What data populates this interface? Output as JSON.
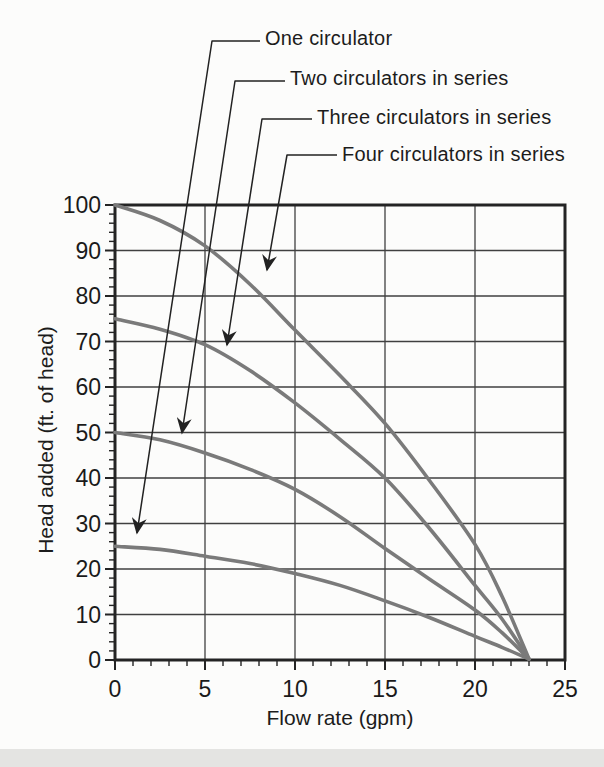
{
  "page": {
    "background_color": "#fcfcfb",
    "footer_band_color": "#e4e4e2"
  },
  "chart_data": {
    "type": "line",
    "title": "",
    "xlabel": "Flow rate (gpm)",
    "ylabel": "Head added (ft. of head)",
    "xlim": [
      0,
      25
    ],
    "ylim": [
      0,
      100
    ],
    "x_ticks": [
      0,
      5,
      10,
      15,
      20,
      25
    ],
    "y_ticks": [
      0,
      10,
      20,
      30,
      40,
      50,
      60,
      70,
      80,
      90,
      100
    ],
    "x_minor_step": 1,
    "y_minor_step": 2,
    "grid": true,
    "legend_position": "leader-annotations-top",
    "series": [
      {
        "name": "One circulator",
        "points": [
          [
            0,
            25
          ],
          [
            2.5,
            24.3
          ],
          [
            5,
            22.8
          ],
          [
            7.5,
            21.2
          ],
          [
            10,
            19
          ],
          [
            12.5,
            16.4
          ],
          [
            15,
            13
          ],
          [
            17.5,
            9.3
          ],
          [
            20,
            5.2
          ],
          [
            21.5,
            2.8
          ],
          [
            23,
            0.2
          ]
        ]
      },
      {
        "name": "Two circulators in series",
        "points": [
          [
            0,
            50
          ],
          [
            2.5,
            48.4
          ],
          [
            5,
            45.5
          ],
          [
            7.5,
            41.9
          ],
          [
            10,
            37.5
          ],
          [
            12.5,
            31.5
          ],
          [
            15,
            24.5
          ],
          [
            17.5,
            17.7
          ],
          [
            20,
            11
          ],
          [
            21.5,
            6
          ],
          [
            23,
            0.2
          ]
        ]
      },
      {
        "name": "Three circulators in series",
        "points": [
          [
            0,
            75
          ],
          [
            2.5,
            72.7
          ],
          [
            5,
            69.3
          ],
          [
            7.5,
            63.6
          ],
          [
            10,
            56.5
          ],
          [
            12.5,
            48.5
          ],
          [
            15,
            40
          ],
          [
            17.5,
            28.8
          ],
          [
            20,
            16.4
          ],
          [
            21.5,
            9
          ],
          [
            23,
            0.2
          ]
        ]
      },
      {
        "name": "Four circulators in series",
        "points": [
          [
            0,
            100
          ],
          [
            2.5,
            96.6
          ],
          [
            5,
            91
          ],
          [
            7.5,
            82.6
          ],
          [
            10,
            72.5
          ],
          [
            12.5,
            62.5
          ],
          [
            15,
            52
          ],
          [
            17.5,
            39.3
          ],
          [
            20,
            25.4
          ],
          [
            21.5,
            14
          ],
          [
            23,
            0.2
          ]
        ]
      }
    ],
    "annotations": [
      {
        "text": "One circulator",
        "text_left": 265,
        "center_y": 39,
        "elbow": [
          212,
          41
        ],
        "tip": [
          137,
          533
        ]
      },
      {
        "text": "Two circulators in series",
        "text_left": 290,
        "center_y": 79,
        "elbow": [
          235,
          81
        ],
        "tip": [
          182,
          433
        ]
      },
      {
        "text": "Three circulators in series",
        "text_left": 317,
        "center_y": 118,
        "elbow": [
          262,
          119
        ],
        "tip": [
          227,
          345
        ]
      },
      {
        "text": "Four circulators in series",
        "text_left": 342,
        "center_y": 155,
        "elbow": [
          287,
          155
        ],
        "tip": [
          267,
          270
        ]
      }
    ],
    "colors": {
      "curve": "#7a7a7a",
      "grid": "#404040",
      "frame": "#242424",
      "leader": "#222222",
      "text": "#1a1a1a"
    }
  }
}
